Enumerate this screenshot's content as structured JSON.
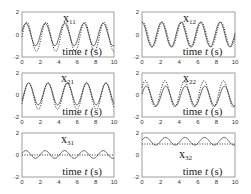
{
  "chart_data": [
    {
      "type": "line",
      "id": "x11",
      "title": "x11",
      "xlabel": "time t (s)",
      "xlim": [
        0,
        10
      ],
      "ylim": [
        -2,
        2
      ],
      "xticks": [
        0,
        2,
        4,
        6,
        8,
        10
      ],
      "yticks": [
        -2,
        0,
        2
      ],
      "series": [
        {
          "name": "solid",
          "style": "solid",
          "amplitude": 1.0,
          "offset": 0,
          "period": 2.1,
          "phase": 0.3
        },
        {
          "name": "dotted",
          "style": "dotted",
          "amplitude": 1.3,
          "offset": -0.2,
          "period": 2.1,
          "phase": 0.0
        }
      ]
    },
    {
      "type": "line",
      "id": "x12",
      "title": "x12",
      "xlabel": "time t (s)",
      "xlim": [
        0,
        10
      ],
      "ylim": [
        -2,
        2
      ],
      "xticks": [
        0,
        2,
        4,
        6,
        8,
        10
      ],
      "yticks": [
        -2,
        0,
        2
      ],
      "series": [
        {
          "name": "solid",
          "style": "solid",
          "amplitude": 1.1,
          "offset": 0,
          "period": 2.1,
          "phase": 1.6
        },
        {
          "name": "dotted",
          "style": "dotted",
          "amplitude": 1.1,
          "offset": 0,
          "period": 2.1,
          "phase": 1.3
        }
      ]
    },
    {
      "type": "line",
      "id": "x21",
      "title": "x21",
      "xlabel": "time t (s)",
      "xlim": [
        0,
        10
      ],
      "ylim": [
        -2,
        2
      ],
      "xticks": [
        0,
        2,
        4,
        6,
        8,
        10
      ],
      "yticks": [
        -2,
        0,
        2
      ],
      "series": [
        {
          "name": "solid",
          "style": "solid",
          "amplitude": 1.0,
          "offset": 0.1,
          "period": 2.1,
          "phase": -0.6
        },
        {
          "name": "dotted",
          "style": "dotted",
          "amplitude": 1.2,
          "offset": -0.1,
          "period": 2.1,
          "phase": -0.6
        }
      ]
    },
    {
      "type": "line",
      "id": "x22",
      "title": "x22",
      "xlabel": "time t (s)",
      "xlim": [
        0,
        10
      ],
      "ylim": [
        -2,
        2
      ],
      "xticks": [
        0,
        2,
        4,
        6,
        8,
        10
      ],
      "yticks": [
        -2,
        0,
        2
      ],
      "series": [
        {
          "name": "solid",
          "style": "solid",
          "amplitude": 0.9,
          "offset": -0.1,
          "period": 2.1,
          "phase": 0.2
        },
        {
          "name": "dotted",
          "style": "dotted",
          "amplitude": 1.2,
          "offset": 0.1,
          "period": 2.1,
          "phase": 0.5
        }
      ]
    },
    {
      "type": "line",
      "id": "x31",
      "title": "x31",
      "xlabel": "time t (s)",
      "xlim": [
        0,
        10
      ],
      "ylim": [
        -2,
        2
      ],
      "xticks": [
        0,
        2,
        4,
        6,
        8,
        10
      ],
      "yticks": [
        -2,
        0,
        2
      ],
      "series": [
        {
          "name": "solid",
          "style": "solid",
          "amplitude": 0.35,
          "offset": 0.05,
          "period": 2.1,
          "phase": 0.3
        },
        {
          "name": "dotted",
          "style": "dotted",
          "amplitude": 0.0,
          "offset": 0.0,
          "period": 2.1,
          "phase": 0
        }
      ]
    },
    {
      "type": "line",
      "id": "x32",
      "title": "x32",
      "xlabel": "time t (s)",
      "xlim": [
        0,
        10
      ],
      "ylim": [
        -2,
        2
      ],
      "xticks": [
        0,
        2,
        4,
        6,
        8,
        10
      ],
      "yticks": [
        -2,
        0,
        2
      ],
      "series": [
        {
          "name": "solid",
          "style": "solid",
          "amplitude": 0.35,
          "offset": 1.25,
          "period": 2.1,
          "phase": 0.3
        },
        {
          "name": "dotted",
          "style": "dotted",
          "amplitude": 0.0,
          "offset": 1.0,
          "period": 2.1,
          "phase": 0
        }
      ]
    }
  ],
  "labels": {
    "xlabel": "time t (s)"
  }
}
